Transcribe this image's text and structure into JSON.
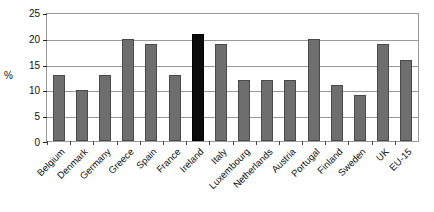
{
  "chart_data": {
    "type": "bar",
    "title": "",
    "xlabel": "",
    "ylabel": "%",
    "ylim": [
      0,
      25
    ],
    "ytick_values": [
      25,
      20,
      15,
      10,
      5,
      0
    ],
    "ytick_labels": [
      "25",
      "20",
      "15",
      "10",
      "5",
      "0"
    ],
    "grid": true,
    "legend": false,
    "categories": [
      "Belgium",
      "Denmark",
      "Germany",
      "Greece",
      "Spain",
      "France",
      "Ireland",
      "Italy",
      "Luxembourg",
      "Netherlands",
      "Austria",
      "Portugal",
      "Finland",
      "Sweden",
      "UK",
      "EU-15"
    ],
    "values": [
      13,
      10,
      13,
      20,
      19,
      13,
      21,
      19,
      12,
      12,
      12,
      20,
      11,
      9,
      19,
      16
    ],
    "highlighted_category": "Ireland",
    "colors": {
      "bar": "#6e6e6e",
      "bar_border": "#4a4a4a",
      "highlight_bar": "#0b0b0b",
      "grid": "#9a9a9a",
      "axis": "#222222",
      "background": "#ffffff",
      "text": "#111111"
    }
  }
}
